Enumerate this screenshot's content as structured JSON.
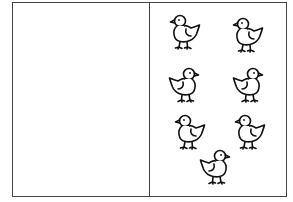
{
  "diagram": {
    "left_panel": {
      "items": []
    },
    "right_panel": {
      "item_type": "chick",
      "count": 7,
      "items": [
        {
          "x": 186,
          "y": 32,
          "facing": "left"
        },
        {
          "x": 249,
          "y": 35,
          "facing": "left"
        },
        {
          "x": 183,
          "y": 85,
          "facing": "right"
        },
        {
          "x": 247,
          "y": 85,
          "facing": "right"
        },
        {
          "x": 191,
          "y": 132,
          "facing": "left"
        },
        {
          "x": 251,
          "y": 132,
          "facing": "left"
        },
        {
          "x": 214,
          "y": 167,
          "facing": "right"
        }
      ]
    },
    "colors": {
      "stroke": "#111111",
      "border": "#444444",
      "background": "#ffffff"
    }
  }
}
